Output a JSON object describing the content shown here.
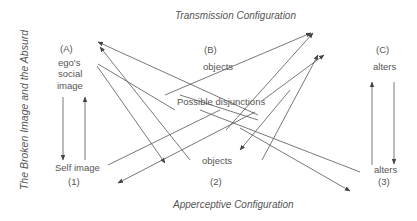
{
  "diagram": {
    "side_title": "The Broken Image and the Absurd",
    "top_title": "Transmission Configuration",
    "bottom_title": "Apperceptive Configuration",
    "center_label": "Possible disjunctions",
    "columns": [
      {
        "id": "A",
        "header": "(A)",
        "top_label_lines": [
          "ego's",
          "social",
          "image"
        ],
        "bottom_label": "Self image",
        "bottom_number": "(1)"
      },
      {
        "id": "B",
        "header": "(B)",
        "top_label_lines": [
          "objects"
        ],
        "bottom_label": "objects",
        "bottom_number": "(2)"
      },
      {
        "id": "C",
        "header": "(C)",
        "top_label_lines": [
          "alters"
        ],
        "bottom_label": "alters",
        "bottom_number": "(3)"
      }
    ],
    "line_color": "#555555",
    "text_color": "#555555"
  }
}
